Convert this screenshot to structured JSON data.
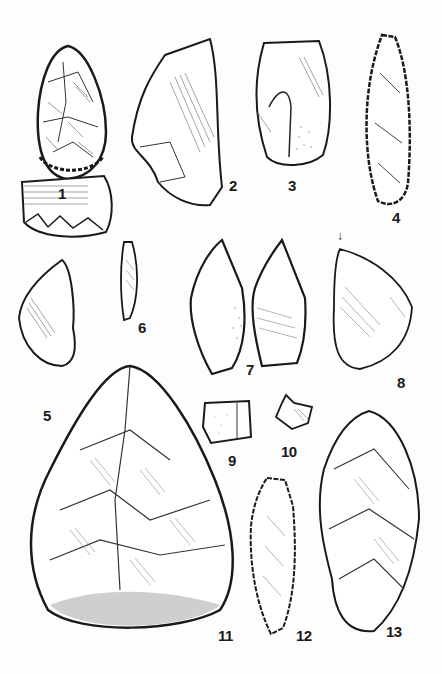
{
  "plate": {
    "background": "#fdfdfd",
    "ink": "#1a1a1a",
    "artifacts": [
      {
        "id": "1",
        "label": "1",
        "kind": "bifacial-tool-with-profile"
      },
      {
        "id": "2",
        "label": "2",
        "kind": "flake"
      },
      {
        "id": "3",
        "label": "3",
        "kind": "core-flake-with-cortex"
      },
      {
        "id": "4",
        "label": "4",
        "kind": "elongated-retouched-blade"
      },
      {
        "id": "5",
        "label": "5",
        "kind": "side-scraper"
      },
      {
        "id": "6",
        "label": "6",
        "kind": "bladelet"
      },
      {
        "id": "7",
        "label": "7",
        "kind": "point-two-views"
      },
      {
        "id": "8",
        "label": "8",
        "kind": "flake-with-burin-blow"
      },
      {
        "id": "9",
        "label": "9",
        "kind": "small-core"
      },
      {
        "id": "10",
        "label": "10",
        "kind": "small-flake"
      },
      {
        "id": "11",
        "label": "11",
        "kind": "handaxe"
      },
      {
        "id": "12",
        "label": "12",
        "kind": "retouched-blade"
      },
      {
        "id": "13",
        "label": "13",
        "kind": "large-scraper"
      }
    ],
    "marker": {
      "glyph": "↓",
      "name": "burin-blow-arrow"
    }
  }
}
